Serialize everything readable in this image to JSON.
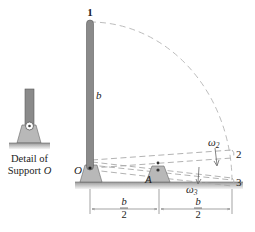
{
  "figure": {
    "point_labels": {
      "p1": "1",
      "p2": "2",
      "p3": "3"
    },
    "bar_label": "b",
    "support_O_label": "O",
    "support_A_label": "A",
    "omega2_label": "ω",
    "omega2_sub": "2",
    "omega3_label": "ω",
    "omega3_sub": "3",
    "dim_left": {
      "num": "b",
      "den": "2"
    },
    "dim_right": {
      "num": "b",
      "den": "2"
    },
    "detail_caption_line1": "Detail of",
    "detail_caption_line2_prefix": "Support ",
    "detail_caption_line2_italic": "O"
  },
  "colors": {
    "bar": "#8a8a8a",
    "bar_edge": "#5a5a5a",
    "support": "#b8b8b8",
    "ground": "#c8c8c8",
    "dashed": "#bdbdbd",
    "text": "#222222"
  }
}
